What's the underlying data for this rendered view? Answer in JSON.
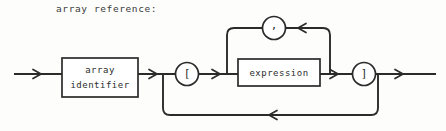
{
  "caption": "array reference:",
  "diagram": {
    "type": "railroad-syntax-diagram",
    "title": "array reference:",
    "stroke_color": "#2b2b2b",
    "fill_color": "#ffffff",
    "background_color": "#fdfdfb",
    "nodes": {
      "array_identifier_box": {
        "label_line1": "array",
        "label_line2": "identifier",
        "shape": "rectangle"
      },
      "open_bracket_terminal": {
        "label": "[",
        "shape": "circle"
      },
      "expression_box": {
        "label": "expression",
        "shape": "rectangle"
      },
      "close_bracket_terminal": {
        "label": "]",
        "shape": "circle"
      },
      "comma_terminal": {
        "label": ",",
        "shape": "circle"
      }
    },
    "paths": [
      "entry -> array identifier -> open bracket -> expression -> close bracket -> exit",
      "repeat loop: expression -> comma -> expression",
      "optional loop: before open bracket -> after close bracket"
    ]
  }
}
